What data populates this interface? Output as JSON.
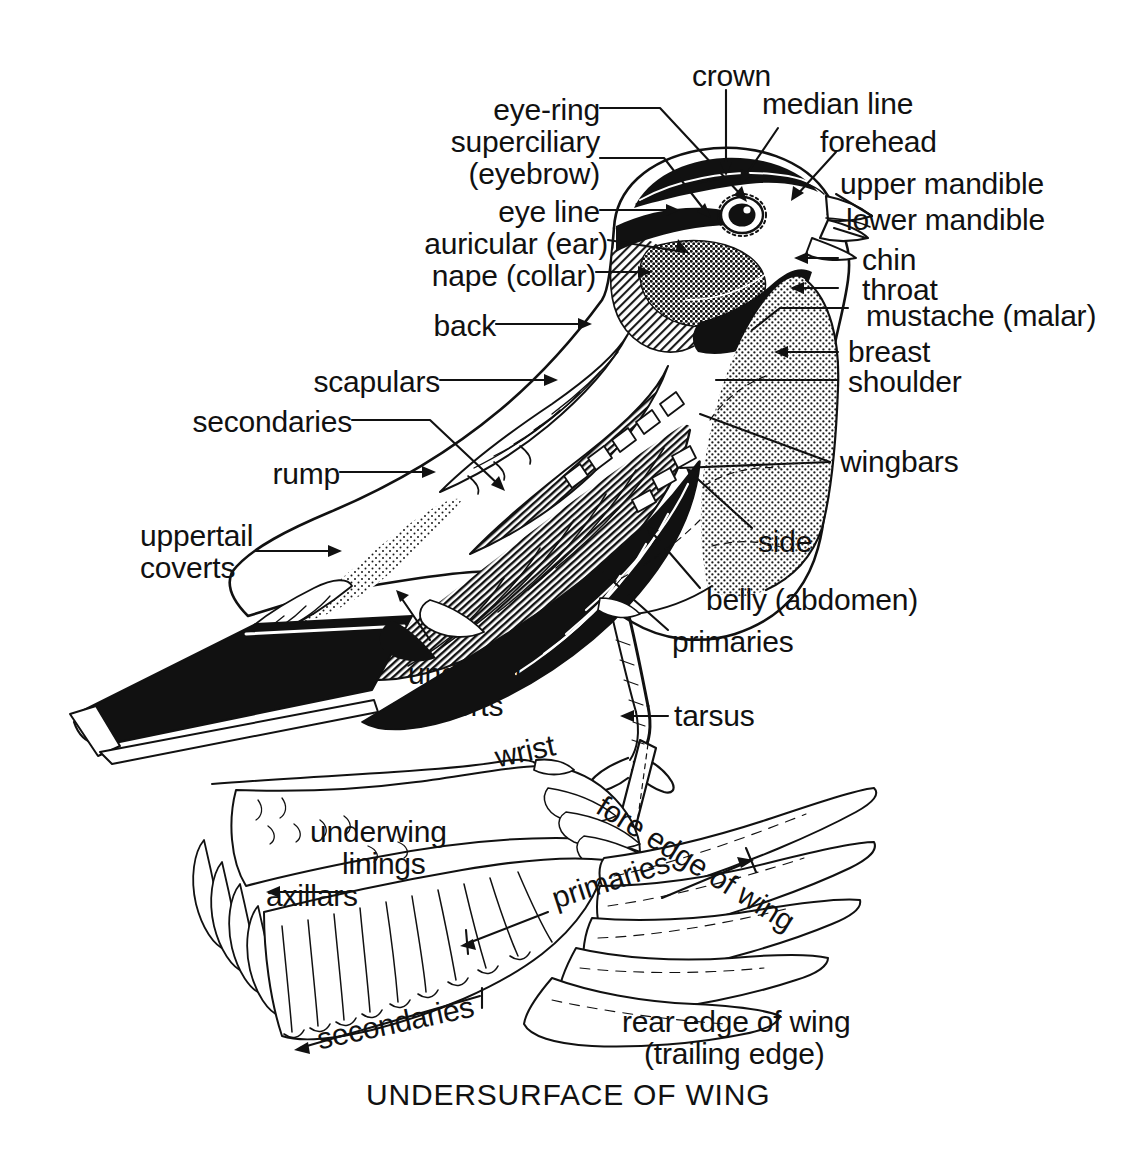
{
  "figure": {
    "caption": "UNDERSURFACE OF WING",
    "ink_color": "#111111",
    "background_color": "#ffffff"
  },
  "upper_diagram": {
    "name": "perched-bird-topography",
    "labels": {
      "crown": "crown",
      "median_line": "median line",
      "forehead": "forehead",
      "upper_mandible": "upper mandible",
      "lower_mandible": "lower mandible",
      "chin": "chin",
      "throat": "throat",
      "mustache": "mustache (malar)",
      "breast": "breast",
      "shoulder": "shoulder",
      "wingbars": "wingbars",
      "side": "side",
      "belly": "belly (abdomen)",
      "primaries": "primaries",
      "tarsus": "tarsus",
      "eye_ring": "eye-ring",
      "superciliary": "superciliary",
      "eyebrow": "(eyebrow)",
      "eye_line": "eye line",
      "auricular": "auricular (ear)",
      "nape": "nape (collar)",
      "back": "back",
      "scapulars": "scapulars",
      "secondaries": "secondaries",
      "rump": "rump",
      "uppertail": "uppertail",
      "coverts_upper": "coverts",
      "outer_tail_feathers": "outer tail feathers",
      "undertail": "undertail",
      "coverts_under": "coverts"
    }
  },
  "lower_diagram": {
    "name": "undersurface-of-wing",
    "labels": {
      "wrist": "wrist",
      "fore_edge": "fore edge of wing",
      "underwing": "underwing",
      "linings": "linings",
      "axillars": "axillars",
      "primaries": "primaries",
      "secondaries": "secondaries",
      "rear_edge_1": "rear edge of wing",
      "rear_edge_2": "(trailing edge)"
    }
  }
}
